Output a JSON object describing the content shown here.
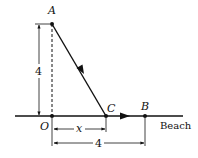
{
  "diagram": {
    "points": {
      "A": {
        "label": "A"
      },
      "O": {
        "label": "O"
      },
      "C": {
        "label": "C"
      },
      "B": {
        "label": "B"
      }
    },
    "dimensions": {
      "height": "4",
      "x": "x",
      "base": "4"
    },
    "beach_label": "Beach",
    "colors": {
      "ink": "#111111",
      "background": "#ffffff"
    }
  }
}
